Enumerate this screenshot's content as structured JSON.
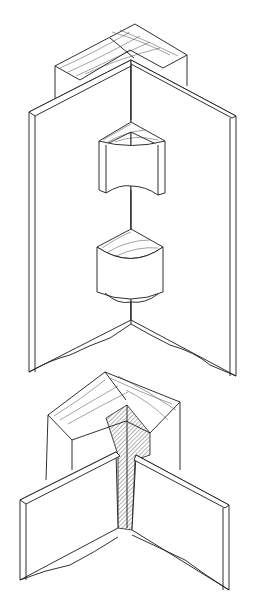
{
  "figure": {
    "type": "technical-illustration",
    "views": [
      {
        "id": "top",
        "description": "outside corner: square wood post with two panels meeting at corner, with cutaway quarter-round blocks"
      },
      {
        "id": "bottom",
        "description": "inside corner: square wood post with laminated core and two panels meeting"
      }
    ],
    "colors": {
      "background": "#ffffff",
      "line": "#1a1a1a"
    }
  }
}
